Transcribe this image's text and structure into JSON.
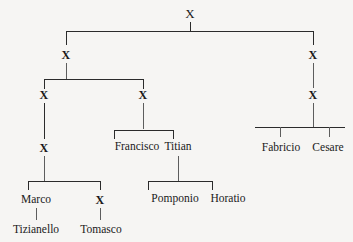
{
  "figure": {
    "type": "genealogy-tree",
    "title": "",
    "background_color": "#f6f5f3",
    "line_color": "#2b2b2b",
    "text_color": "#1a1a1a",
    "unknown_marker": "X"
  },
  "nodes": {
    "root": "X",
    "gen2_left": "X",
    "gen2_right": "X",
    "gen3_left": "X",
    "gen3_mid": "X",
    "gen3_right": "X",
    "gen4_left": "X",
    "francisco": "Francisco",
    "titian": "Titian",
    "fabricio": "Fabricio",
    "cesare": "Cesare",
    "marco": "Marco",
    "gen5_x": "X",
    "pomponio": "Pomponio",
    "horatio": "Horatio",
    "tizianello": "Tizianello",
    "tomasco": "Tomasco"
  },
  "tree_data": {
    "label": "X",
    "children": [
      {
        "label": "X",
        "children": [
          {
            "label": "X",
            "children": [
              {
                "label": "X",
                "children": [
                  {
                    "label": "Marco",
                    "children": [
                      {
                        "label": "Tizianello",
                        "children": []
                      }
                    ]
                  },
                  {
                    "label": "X",
                    "children": [
                      {
                        "label": "Tomasco",
                        "children": []
                      }
                    ]
                  }
                ]
              }
            ]
          },
          {
            "label": "X",
            "children": [
              {
                "label": "Francisco",
                "children": []
              },
              {
                "label": "Titian",
                "children": [
                  {
                    "label": "Pomponio",
                    "children": []
                  },
                  {
                    "label": "Horatio",
                    "children": []
                  }
                ]
              }
            ]
          }
        ]
      },
      {
        "label": "X",
        "children": [
          {
            "label": "X",
            "children": [
              {
                "label": "Fabricio",
                "children": []
              },
              {
                "label": "Cesare",
                "children": []
              }
            ]
          }
        ]
      }
    ]
  }
}
